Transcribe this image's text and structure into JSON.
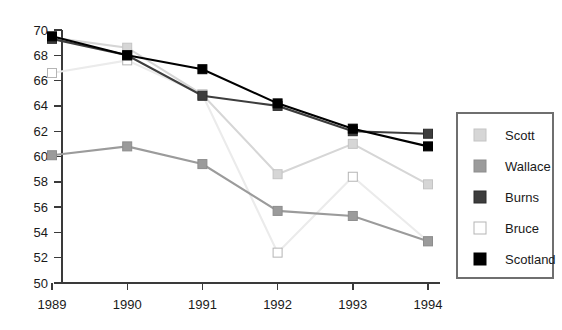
{
  "chart_data": {
    "type": "line",
    "title": "",
    "xlabel": "",
    "ylabel": "",
    "categories": [
      "1989",
      "1990",
      "1991",
      "1992",
      "1993",
      "1994"
    ],
    "x": [
      1989,
      1990,
      1991,
      1992,
      1993,
      1994
    ],
    "ylim": [
      50,
      70
    ],
    "ytick_labels": [
      "50",
      "52",
      "54",
      "56",
      "58",
      "60",
      "62",
      "64",
      "66",
      "68",
      "70"
    ],
    "ytick_values": [
      50,
      52,
      54,
      56,
      58,
      60,
      62,
      64,
      66,
      68,
      70
    ],
    "grid": false,
    "legend_position": "right",
    "series": [
      {
        "name": "Scott",
        "color": "#d6d6d6",
        "marker": "square",
        "marker_fill": "#d6d6d6",
        "marker_stroke": "#c4c4c4",
        "values": [
          69.4,
          68.6,
          64.9,
          58.6,
          61.0,
          57.8
        ]
      },
      {
        "name": "Wallace",
        "color": "#9b9b9b",
        "marker": "square",
        "marker_fill": "#9b9b9b",
        "marker_stroke": "#8d8d8d",
        "values": [
          60.1,
          60.8,
          59.4,
          55.7,
          55.3,
          53.3
        ]
      },
      {
        "name": "Burns",
        "color": "#3d3d3d",
        "marker": "square",
        "marker_fill": "#3d3d3d",
        "marker_stroke": "#2d2d2d",
        "values": [
          69.3,
          68.0,
          64.8,
          64.0,
          62.0,
          61.8
        ]
      },
      {
        "name": "Bruce",
        "color": "#ebebeb",
        "marker": "square",
        "marker_fill": "#ffffff",
        "marker_stroke": "#b5b5b5",
        "values": [
          66.6,
          67.6,
          64.9,
          52.4,
          58.4,
          53.3
        ]
      },
      {
        "name": "Scotland",
        "color": "#000000",
        "marker": "square",
        "marker_fill": "#000000",
        "marker_stroke": "#000000",
        "values": [
          69.5,
          68.0,
          66.9,
          64.2,
          62.2,
          60.8
        ]
      }
    ]
  },
  "legend": {
    "items": [
      {
        "label": "Scott"
      },
      {
        "label": "Wallace"
      },
      {
        "label": "Burns"
      },
      {
        "label": "Bruce"
      },
      {
        "label": "Scotland"
      }
    ]
  }
}
